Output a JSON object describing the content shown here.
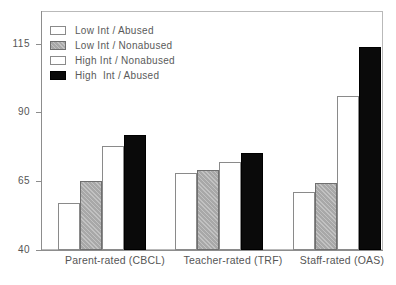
{
  "chart_data": {
    "type": "bar",
    "title": "",
    "xlabel": "",
    "ylabel": "",
    "ylim": [
      40,
      115
    ],
    "yticks": [
      40,
      65,
      90,
      115
    ],
    "ytick_labels": [
      "40",
      "65",
      "90",
      "115"
    ],
    "grid": false,
    "legend_position": "upper-left-inside",
    "categories": [
      "Parent-rated (CBCL)",
      "Teacher-rated (TRF)",
      "Staff-rated (OAS)"
    ],
    "series": [
      {
        "name": "Low Int / Abused",
        "fill": "white",
        "color": "#ffffff",
        "values": [
          57,
          68,
          61
        ]
      },
      {
        "name": "Low Int / Nonabused",
        "fill": "gray-hatched",
        "color": "#a8a8a8",
        "values": [
          65,
          69,
          64.5
        ]
      },
      {
        "name": "High Int / Nonabused",
        "fill": "white",
        "color": "#ffffff",
        "values": [
          78,
          72,
          96
        ]
      },
      {
        "name": "High  Int / Abused",
        "fill": "black",
        "color": "#0a0a0a",
        "values": [
          82,
          75.5,
          114
        ]
      }
    ]
  },
  "legend": {
    "items": [
      {
        "label": "Low Int / Abused",
        "swatch": "white"
      },
      {
        "label": "Low Int / Nonabused",
        "swatch": "gray"
      },
      {
        "label": "High Int / Nonabused",
        "swatch": "white"
      },
      {
        "label": "High  Int / Abused",
        "swatch": "black"
      }
    ]
  },
  "axis": {
    "y_labels": [
      "115",
      "90",
      "65",
      "40"
    ]
  }
}
